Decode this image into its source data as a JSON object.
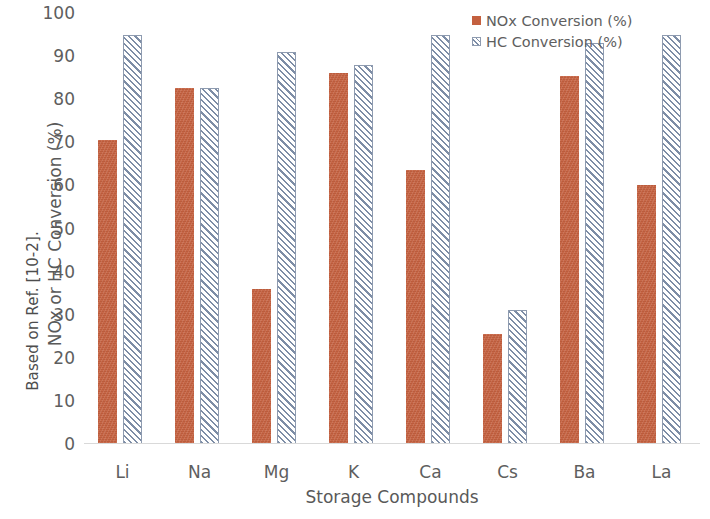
{
  "chart_data": {
    "type": "bar",
    "title": "",
    "categories": [
      "Li",
      "Na",
      "Mg",
      "K",
      "Ca",
      "Cs",
      "Ba",
      "La"
    ],
    "series": [
      {
        "name": "NOx Conversion (%)",
        "color": "#C4603F",
        "values": [
          70.5,
          82.7,
          36.0,
          86.0,
          63.5,
          25.5,
          85.5,
          60.0
        ]
      },
      {
        "name": "HC Conversion (%)",
        "color": "#7D8DA6",
        "values": [
          95.0,
          82.7,
          91.0,
          88.0,
          95.0,
          31.0,
          93.0,
          95.0
        ]
      }
    ],
    "xlabel": "Storage Compounds",
    "ylabel": "NOx or HC Conversion (%)",
    "ylim": [
      0,
      100
    ],
    "y_ticks": [
      0,
      10,
      20,
      30,
      40,
      50,
      60,
      70,
      80,
      90,
      100
    ],
    "grid": false,
    "legend_position": "top-right"
  },
  "caption": {
    "source_note": "Based on Ref. [10-2]."
  },
  "legend": {
    "items": [
      {
        "label": "NOx Conversion (%)",
        "marker": "solid-square-swatch"
      },
      {
        "label": "HC Conversion (%)",
        "marker": "hatched-square-swatch"
      }
    ]
  }
}
